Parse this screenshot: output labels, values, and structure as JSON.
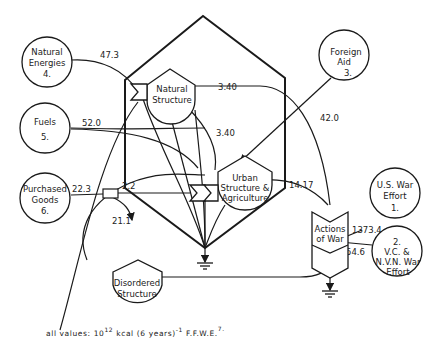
{
  "diagram": {
    "sources": [
      {
        "id": "natural-energies",
        "lines": [
          "Natural",
          "Energies",
          "4."
        ],
        "flow_value": "47.3"
      },
      {
        "id": "fuels",
        "lines": [
          "Fuels",
          "5."
        ],
        "flow_value": "52.0"
      },
      {
        "id": "purchased-goods",
        "lines": [
          "Purchased",
          "Goods",
          "6."
        ],
        "flow_value": "22.3"
      },
      {
        "id": "foreign-aid",
        "lines": [
          "Foreign",
          "Aid",
          "3."
        ],
        "flow_value": "42.0"
      },
      {
        "id": "us-war-effort",
        "lines": [
          "U.S. War",
          "Effort",
          "1."
        ],
        "flow_value": "1373.4"
      },
      {
        "id": "vc-nvn-war-effort",
        "lines": [
          "2.",
          "V.C. &",
          "N.V.N. War",
          "Effort"
        ],
        "flow_value": "54.6"
      }
    ],
    "storages": [
      {
        "id": "natural-structure",
        "lines": [
          "Natural",
          "Structure"
        ]
      },
      {
        "id": "urban-structure",
        "lines": [
          "Urban",
          "Structure &",
          "Agriculture"
        ]
      },
      {
        "id": "disordered-structure",
        "lines": [
          "Disordered",
          "Structure"
        ]
      },
      {
        "id": "actions-of-war",
        "lines": [
          "Actions",
          "of War"
        ]
      }
    ],
    "flows": {
      "natural_to_war": "3.40",
      "natural_to_urban": "3.40",
      "goods_to_urban": "2.2",
      "goods_export": "21.1",
      "urban_to_war": "14.17"
    },
    "footnote": {
      "prefix": "all values:  10",
      "exp": "12",
      "mid": " kcal (6  years)",
      "exp2": "-1",
      "suffix": "  F.F.W.E.",
      "note": "7."
    }
  }
}
